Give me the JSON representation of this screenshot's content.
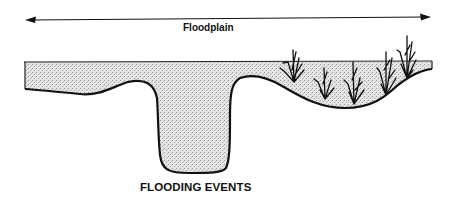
{
  "diagram": {
    "floodplain_label": "Floodplain",
    "caption": "FLOODING EVENTS",
    "elements": [
      "floodplain-extent-arrow",
      "water-surface",
      "river-channel",
      "floodplain-depression",
      "wetland-vegetation"
    ],
    "vegetation_count": 5,
    "colors": {
      "line": "#111111",
      "water_fill": "#d9d9d9",
      "background": "#ffffff"
    }
  }
}
